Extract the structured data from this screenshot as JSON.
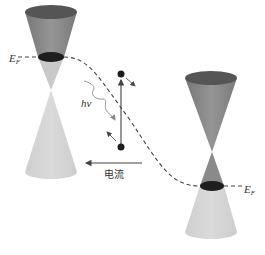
{
  "figure": {
    "type": "band-structure-schematic"
  },
  "labels": {
    "fermi_left": "E",
    "fermi_left_sub": "F",
    "fermi_right": "E",
    "fermi_right_sub": "F",
    "photon": "hν",
    "current": "电流"
  },
  "colors": {
    "upper_cone": "#8a8a8a",
    "upper_cone_top": "#5a5a5a",
    "lower_cone": "#d2d2d2",
    "fermi_disk": "#1e1e1e",
    "line": "#444444",
    "wavy": "#9a9a9a"
  },
  "elements": {
    "left_cone": {
      "apex": [
        51,
        90
      ],
      "top": [
        51,
        12
      ],
      "bottom": [
        51,
        172
      ],
      "fermi_level_y": 57
    },
    "right_cone": {
      "apex": [
        212,
        152
      ],
      "top": [
        211,
        78
      ],
      "bottom": [
        211,
        232
      ],
      "fermi_level_y": 186
    },
    "electron_top": [
      121,
      74
    ],
    "hole_bottom": [
      121,
      147
    ],
    "current_arrow": {
      "from": [
        142,
        163
      ],
      "to": [
        84,
        163
      ],
      "direction": "left"
    }
  }
}
